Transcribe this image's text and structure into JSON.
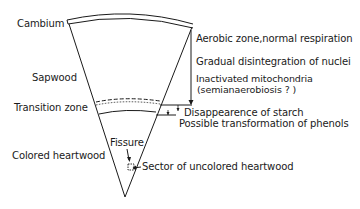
{
  "diagram": {
    "left_labels": {
      "cambium": "Cambium",
      "sapwood": "Sapwood",
      "transition_zone": "Transition  zone",
      "colored_heartwood": "Colored heartwood"
    },
    "right_labels": {
      "aerobic": "Aerobic  zone,normal respiration",
      "nuclei": "Gradual disintegration of nuclei",
      "mitochondria": "Inactivated mitochondria",
      "semianaerobiosis": "(semianaerobiosis ? )",
      "starch": "Disappearence of starch",
      "phenols": "Possible transformation of phenols"
    },
    "inner_labels": {
      "fissure": "Fissure",
      "sector": "Sector of uncolored heartwood"
    },
    "colors": {
      "line": "#1a1a1a",
      "background": "#ffffff"
    }
  }
}
